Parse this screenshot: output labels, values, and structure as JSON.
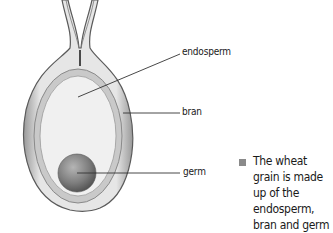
{
  "diagram": {
    "labels": {
      "endosperm": "endosperm",
      "bran": "bran",
      "germ": "germ"
    },
    "caption": "The wheat grain is made up of the endosperm, bran and germ",
    "colors": {
      "outline": "#5a5a5a",
      "bran": "#c9c9c9",
      "endosperm": "#f0f0f0",
      "germ": "#7a7a7a",
      "bullet": "#8a8a8a",
      "text": "#1a1a1a"
    }
  }
}
